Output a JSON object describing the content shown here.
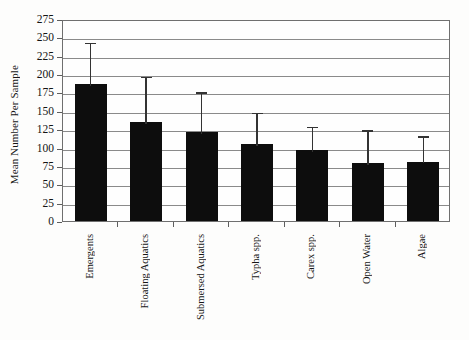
{
  "chart_data": {
    "type": "bar",
    "title": "",
    "xlabel": "",
    "ylabel": "Mean Number Per Sample",
    "ylim": [
      0,
      275
    ],
    "ytick_step": 25,
    "grid": true,
    "legend": "none",
    "categories": [
      "Emergents",
      "Floating Aquatics",
      "Submersed Aquatics",
      "Typha spp.",
      "Carex spp.",
      "Open Water",
      "Algae"
    ],
    "values": [
      187,
      135,
      121,
      105,
      97,
      79,
      81
    ],
    "error_upper": [
      245,
      199,
      178,
      150,
      131,
      126,
      118
    ],
    "ytick_labels": [
      "0",
      "25",
      "50",
      "75",
      "100",
      "125",
      "150",
      "175",
      "200",
      "225",
      "250",
      "275"
    ],
    "ytick_values": [
      0,
      25,
      50,
      75,
      100,
      125,
      150,
      175,
      200,
      225,
      250,
      275
    ],
    "series": [
      {
        "name": "Mean Number Per Sample",
        "values": [
          187,
          135,
          121,
          105,
          97,
          79,
          81
        ],
        "error_upper": [
          245,
          199,
          178,
          150,
          131,
          126,
          118
        ],
        "color": "#0d0d0d"
      }
    ]
  },
  "colors": {
    "bar": "#0d0d0d",
    "grid": "#8a8a8a",
    "axis": "#6f6f6f",
    "error": "#333333",
    "background": "#fdfdfc",
    "text": "#141414"
  }
}
